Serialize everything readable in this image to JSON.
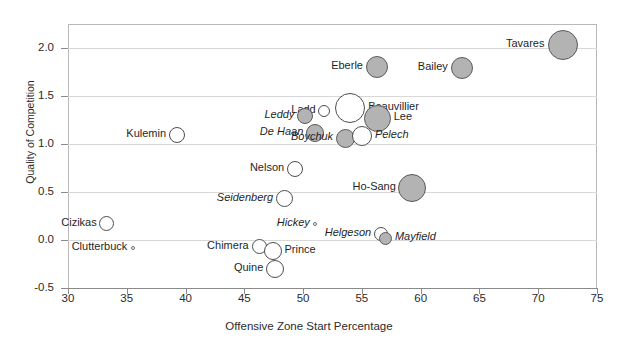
{
  "chart_data": {
    "type": "scatter",
    "title": "",
    "xlabel": "Offensive Zone Start Percentage",
    "ylabel": "Quality of Competition",
    "xlim": [
      30,
      75
    ],
    "ylim": [
      -0.5,
      2.25
    ],
    "xticks": [
      "30",
      "35",
      "40",
      "45",
      "50",
      "55",
      "60",
      "65",
      "70",
      "75"
    ],
    "xtick_values": [
      30,
      35,
      40,
      45,
      50,
      55,
      60,
      65,
      70,
      75
    ],
    "yticks": [
      "2.0",
      "1.5",
      "1.0",
      "0.5",
      "0.0",
      "-0.5"
    ],
    "ytick_values": [
      2.0,
      1.5,
      1.0,
      0.5,
      0.0,
      -0.5
    ],
    "grid": "horizontal-light",
    "legend": "none",
    "size_encoding": "bubble area = time on ice / usage",
    "points": [
      {
        "label": "Tavares",
        "x": 72.1,
        "y": 2.03,
        "size": 30,
        "style": "fill",
        "italic": false,
        "label_side": "left"
      },
      {
        "label": "Bailey",
        "x": 63.5,
        "y": 1.79,
        "size": 22,
        "style": "fill",
        "italic": false,
        "label_side": "left"
      },
      {
        "label": "Eberle",
        "x": 56.3,
        "y": 1.8,
        "size": 22,
        "style": "fill",
        "italic": false,
        "label_side": "left"
      },
      {
        "label": "Ladd",
        "x": 51.8,
        "y": 1.34,
        "size": 12,
        "style": "open",
        "italic": false,
        "label_side": "left"
      },
      {
        "label": "Beauvillier",
        "x": 54.0,
        "y": 1.38,
        "size": 30,
        "style": "open",
        "italic": false,
        "label_side": "right"
      },
      {
        "label": "Lee",
        "x": 56.3,
        "y": 1.27,
        "size": 27,
        "style": "fill",
        "italic": false,
        "label_side": "right"
      },
      {
        "label": "Leddy",
        "x": 50.2,
        "y": 1.29,
        "size": 16,
        "style": "fill",
        "italic": true,
        "label_side": "left"
      },
      {
        "label": "De Haan",
        "x": 51.0,
        "y": 1.11,
        "size": 18,
        "style": "fill",
        "italic": true,
        "label_side": "left"
      },
      {
        "label": "Boychuk",
        "x": 53.6,
        "y": 1.06,
        "size": 19,
        "style": "fill",
        "italic": true,
        "label_side": "left"
      },
      {
        "label": "Pelech",
        "x": 55.0,
        "y": 1.08,
        "size": 20,
        "style": "open",
        "italic": true,
        "label_side": "right"
      },
      {
        "label": "Kulemin",
        "x": 39.3,
        "y": 1.09,
        "size": 16,
        "style": "open",
        "italic": false,
        "label_side": "left"
      },
      {
        "label": "Nelson",
        "x": 49.3,
        "y": 0.74,
        "size": 16,
        "style": "open",
        "italic": false,
        "label_side": "left"
      },
      {
        "label": "Ho-Sang",
        "x": 59.3,
        "y": 0.54,
        "size": 28,
        "style": "fill",
        "italic": false,
        "label_side": "left"
      },
      {
        "label": "Seidenberg",
        "x": 48.4,
        "y": 0.43,
        "size": 17,
        "style": "open",
        "italic": true,
        "label_side": "left"
      },
      {
        "label": "Cizikas",
        "x": 33.3,
        "y": 0.17,
        "size": 15,
        "style": "open",
        "italic": false,
        "label_side": "left"
      },
      {
        "label": "Hickey",
        "x": 51.0,
        "y": 0.17,
        "size": 4,
        "style": "dot",
        "italic": true,
        "label_side": "left"
      },
      {
        "label": "Helgeson",
        "x": 56.6,
        "y": 0.06,
        "size": 14,
        "style": "open",
        "italic": true,
        "label_side": "left"
      },
      {
        "label": "Mayfield",
        "x": 57.0,
        "y": 0.02,
        "size": 13,
        "style": "fill",
        "italic": true,
        "label_side": "right"
      },
      {
        "label": "Clutterbuck",
        "x": 35.5,
        "y": -0.08,
        "size": 4,
        "style": "dot",
        "italic": false,
        "label_side": "left"
      },
      {
        "label": "Chimera",
        "x": 46.3,
        "y": -0.07,
        "size": 15,
        "style": "open",
        "italic": false,
        "label_side": "left"
      },
      {
        "label": "Prince",
        "x": 47.4,
        "y": -0.11,
        "size": 18,
        "style": "open",
        "italic": false,
        "label_side": "right"
      },
      {
        "label": "Quine",
        "x": 47.6,
        "y": -0.3,
        "size": 18,
        "style": "open",
        "italic": false,
        "label_side": "left"
      }
    ]
  }
}
